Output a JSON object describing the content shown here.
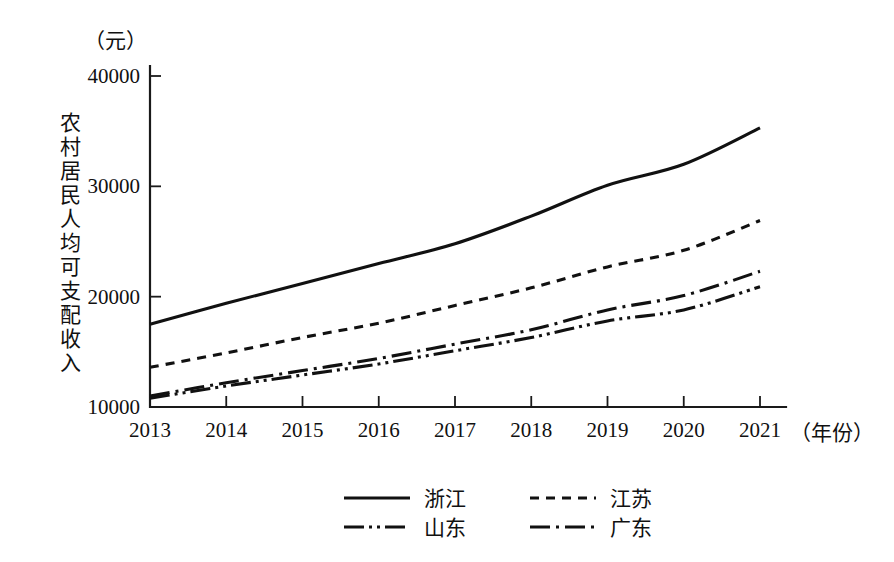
{
  "chart_data": {
    "type": "line",
    "title": "",
    "xlabel": "（年份）",
    "ylabel": "农村居民人均可支配收入",
    "yunit": "（元）",
    "categories": [
      "2013",
      "2014",
      "2015",
      "2016",
      "2017",
      "2018",
      "2019",
      "2020",
      "2021"
    ],
    "x": [
      2013,
      2014,
      2015,
      2016,
      2017,
      2018,
      2019,
      2020,
      2021
    ],
    "xlim": [
      2013,
      2021
    ],
    "ylim": [
      10000,
      40000
    ],
    "yticks": [
      10000,
      20000,
      30000,
      40000
    ],
    "ytick_labels": [
      "10000",
      "20000",
      "30000",
      "40000"
    ],
    "grid": false,
    "legend_position": "bottom",
    "series": [
      {
        "name": "浙江",
        "dash": "solid",
        "values": [
          17500,
          19400,
          21200,
          23000,
          24800,
          27300,
          30100,
          32000,
          35300
        ]
      },
      {
        "name": "江苏",
        "dash": "dashed",
        "values": [
          13600,
          14900,
          16300,
          17600,
          19200,
          20800,
          22700,
          24200,
          26900
        ]
      },
      {
        "name": "山东",
        "dash": "dash-dot-dot",
        "values": [
          10800,
          11900,
          12900,
          13900,
          15100,
          16300,
          17800,
          18800,
          20900
        ]
      },
      {
        "name": "广东",
        "dash": "dash-dot",
        "values": [
          11000,
          12200,
          13300,
          14400,
          15700,
          17000,
          18800,
          20100,
          22300
        ]
      }
    ]
  },
  "legend": {
    "entries": [
      {
        "label": "浙江",
        "dash": "solid"
      },
      {
        "label": "江苏",
        "dash": "dashed"
      },
      {
        "label": "山东",
        "dash": "dash-dot-dot"
      },
      {
        "label": "广东",
        "dash": "dash-dot"
      }
    ]
  },
  "colors": {
    "ink": "#111111",
    "background": "#ffffff"
  }
}
